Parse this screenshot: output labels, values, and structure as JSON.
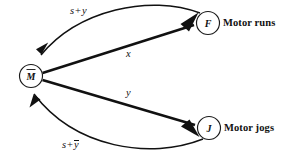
{
  "diagram": {
    "background_color": "#ffffff",
    "line_color": "#111111",
    "nodes": [
      {
        "id": "M",
        "label": "M",
        "overbar": true,
        "description": "",
        "cx": 31,
        "cy": 76,
        "r": 11.5
      },
      {
        "id": "F",
        "label": "F",
        "overbar": false,
        "description": "Motor runs",
        "cx": 208,
        "cy": 23,
        "r": 11.5
      },
      {
        "id": "J",
        "label": "J",
        "overbar": false,
        "description": "Motor jogs",
        "cx": 209,
        "cy": 128,
        "r": 11.5
      }
    ],
    "edges": [
      {
        "id": "f-to-m",
        "from": "F",
        "to": "M",
        "style": "curved",
        "label_terms": [
          "s",
          "+",
          "y"
        ],
        "label_overbar_last": false,
        "label_text": "s + y"
      },
      {
        "id": "m-to-f",
        "from": "M",
        "to": "F",
        "style": "straight",
        "label_terms": [
          "x"
        ],
        "label_overbar_last": false,
        "label_text": "x"
      },
      {
        "id": "m-to-j",
        "from": "M",
        "to": "J",
        "style": "straight",
        "label_terms": [
          "y"
        ],
        "label_overbar_last": false,
        "label_text": "y"
      },
      {
        "id": "j-to-m",
        "from": "J",
        "to": "M",
        "style": "curved",
        "label_terms": [
          "s",
          "+",
          "y"
        ],
        "label_overbar_last": true,
        "label_text": "s + ȳ"
      }
    ],
    "labels": {
      "edge_s_plus_y": {
        "s": "s",
        "plus": "+",
        "y": "y"
      },
      "edge_x": "x",
      "edge_y": "y",
      "edge_s_plus_ybar": {
        "s": "s",
        "plus": "+",
        "y": "y"
      },
      "node_m": "M",
      "node_f": "F",
      "node_j": "J",
      "desc_f": "Motor runs",
      "desc_j": "Motor jogs"
    }
  }
}
